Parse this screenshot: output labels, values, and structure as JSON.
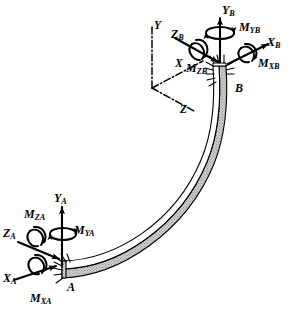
{
  "figure": {
    "background_color": "#ffffff",
    "line_color": "#000000",
    "beam_shade_color": "#c9c9c9",
    "width": 289,
    "height": 310
  },
  "global_axes": {
    "name": "global-coordinate-triad",
    "style": "dash-dot",
    "origin": [
      152,
      88
    ],
    "axes": [
      {
        "label": "Y",
        "direction": "up",
        "end": [
          152,
          26
        ]
      },
      {
        "label": "X",
        "direction": "upper-right",
        "end": [
          205,
          60
        ]
      },
      {
        "label": "Z",
        "direction": "lower-right",
        "end": [
          196,
          112
        ]
      }
    ]
  },
  "nodes": [
    {
      "id": "A",
      "label": "A",
      "position": [
        70,
        288
      ],
      "support": "fixed-hatched"
    },
    {
      "id": "B",
      "label": "B",
      "position": [
        238,
        89
      ],
      "support": "fixed-hatched"
    }
  ],
  "end_A": {
    "node_label": "A",
    "forces": [
      {
        "name": "Y_A",
        "base": "Y",
        "sub": "A",
        "label_pos": [
          57,
          197
        ]
      },
      {
        "name": "Z_A",
        "base": "Z",
        "sub": "A",
        "label_pos": [
          6,
          232
        ]
      },
      {
        "name": "X_A",
        "base": "X",
        "sub": "A",
        "label_pos": [
          6,
          277
        ]
      }
    ],
    "moments": [
      {
        "name": "M_YA",
        "base": "M",
        "sub": "YA",
        "label_pos": [
          76,
          228
        ]
      },
      {
        "name": "M_ZA",
        "base": "M",
        "sub": "ZA",
        "label_pos": [
          27,
          213
        ]
      },
      {
        "name": "M_XA",
        "base": "M",
        "sub": "XA",
        "label_pos": [
          33,
          297
        ]
      }
    ]
  },
  "end_B": {
    "node_label": "B",
    "forces": [
      {
        "name": "Y_B",
        "base": "Y",
        "sub": "B",
        "label_pos": [
          225,
          8
        ]
      },
      {
        "name": "Z_B",
        "base": "Z",
        "sub": "B",
        "label_pos": [
          174,
          32
        ]
      },
      {
        "name": "X_B",
        "base": "X",
        "sub": "B",
        "label_pos": [
          268,
          41
        ]
      }
    ],
    "moments": [
      {
        "name": "M_YB",
        "base": "M",
        "sub": "YB",
        "label_pos": [
          240,
          26
        ]
      },
      {
        "name": "M_ZB",
        "base": "M",
        "sub": "ZB",
        "label_pos": [
          190,
          67
        ]
      },
      {
        "name": "M_XB",
        "base": "M",
        "sub": "XB",
        "label_pos": [
          262,
          62
        ]
      }
    ]
  },
  "beam": {
    "name": "curved-beam",
    "shape": "circular-arc",
    "from_node": "A",
    "to_node": "B",
    "top_face": "white",
    "side_face": "gray-stipple"
  }
}
